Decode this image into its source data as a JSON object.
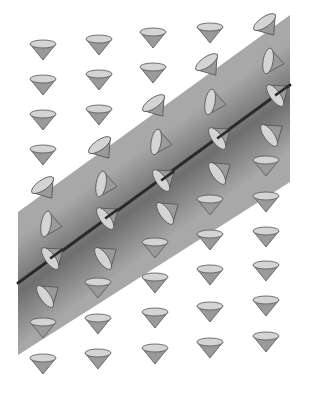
{
  "figure": {
    "colors": {
      "background": "#ffffff",
      "band_edge": "#a8a8a8",
      "band_center": "#6e6e6e",
      "line": "#2a2a2a",
      "cone_fill": "#9a9a9a",
      "cone_top": "#d4d4d4",
      "cone_stroke": "#555555"
    },
    "band": {
      "left_x": 18,
      "right_x": 290,
      "left_top_y": 212,
      "left_bottom_y": 355,
      "right_top_y": 15,
      "right_bottom_y": 182
    },
    "center_line": {
      "x1": 18,
      "y1": 283,
      "x2": 290,
      "y2": 85
    },
    "cones": [
      {
        "x": 43,
        "y": 50,
        "o": "down"
      },
      {
        "x": 99,
        "y": 45,
        "o": "down"
      },
      {
        "x": 153,
        "y": 38,
        "o": "down"
      },
      {
        "x": 210,
        "y": 33,
        "o": "down"
      },
      {
        "x": 268,
        "y": 27,
        "o": "tilt1"
      },
      {
        "x": 43,
        "y": 85,
        "o": "down"
      },
      {
        "x": 99,
        "y": 80,
        "o": "down"
      },
      {
        "x": 153,
        "y": 73,
        "o": "down"
      },
      {
        "x": 210,
        "y": 67,
        "o": "tilt1"
      },
      {
        "x": 274,
        "y": 62,
        "o": "tilt2"
      },
      {
        "x": 43,
        "y": 120,
        "o": "down"
      },
      {
        "x": 99,
        "y": 115,
        "o": "down"
      },
      {
        "x": 157,
        "y": 108,
        "o": "tilt1"
      },
      {
        "x": 216,
        "y": 103,
        "o": "tilt2"
      },
      {
        "x": 280,
        "y": 92,
        "o": "axis"
      },
      {
        "x": 43,
        "y": 155,
        "o": "down"
      },
      {
        "x": 103,
        "y": 150,
        "o": "tilt1"
      },
      {
        "x": 162,
        "y": 143,
        "o": "tilt2"
      },
      {
        "x": 222,
        "y": 135,
        "o": "axis"
      },
      {
        "x": 274,
        "y": 132,
        "o": "tilt3"
      },
      {
        "x": 46,
        "y": 190,
        "o": "tilt1"
      },
      {
        "x": 107,
        "y": 185,
        "o": "tilt2"
      },
      {
        "x": 166,
        "y": 177,
        "o": "axis"
      },
      {
        "x": 222,
        "y": 170,
        "o": "tilt3"
      },
      {
        "x": 266,
        "y": 166,
        "o": "down"
      },
      {
        "x": 52,
        "y": 225,
        "o": "tilt2"
      },
      {
        "x": 110,
        "y": 215,
        "o": "axis"
      },
      {
        "x": 170,
        "y": 210,
        "o": "tilt3"
      },
      {
        "x": 210,
        "y": 205,
        "o": "down"
      },
      {
        "x": 266,
        "y": 202,
        "o": "down"
      },
      {
        "x": 55,
        "y": 255,
        "o": "axis"
      },
      {
        "x": 108,
        "y": 255,
        "o": "tilt3"
      },
      {
        "x": 155,
        "y": 248,
        "o": "down"
      },
      {
        "x": 210,
        "y": 240,
        "o": "down"
      },
      {
        "x": 266,
        "y": 237,
        "o": "down"
      },
      {
        "x": 50,
        "y": 293,
        "o": "tilt3"
      },
      {
        "x": 98,
        "y": 288,
        "o": "down"
      },
      {
        "x": 155,
        "y": 283,
        "o": "down"
      },
      {
        "x": 210,
        "y": 275,
        "o": "down"
      },
      {
        "x": 266,
        "y": 271,
        "o": "down"
      },
      {
        "x": 43,
        "y": 328,
        "o": "down"
      },
      {
        "x": 98,
        "y": 324,
        "o": "down"
      },
      {
        "x": 155,
        "y": 318,
        "o": "down"
      },
      {
        "x": 210,
        "y": 312,
        "o": "down"
      },
      {
        "x": 266,
        "y": 306,
        "o": "down"
      },
      {
        "x": 43,
        "y": 364,
        "o": "down"
      },
      {
        "x": 98,
        "y": 359,
        "o": "down"
      },
      {
        "x": 155,
        "y": 354,
        "o": "down"
      },
      {
        "x": 210,
        "y": 348,
        "o": "down"
      },
      {
        "x": 266,
        "y": 342,
        "o": "down"
      }
    ]
  }
}
